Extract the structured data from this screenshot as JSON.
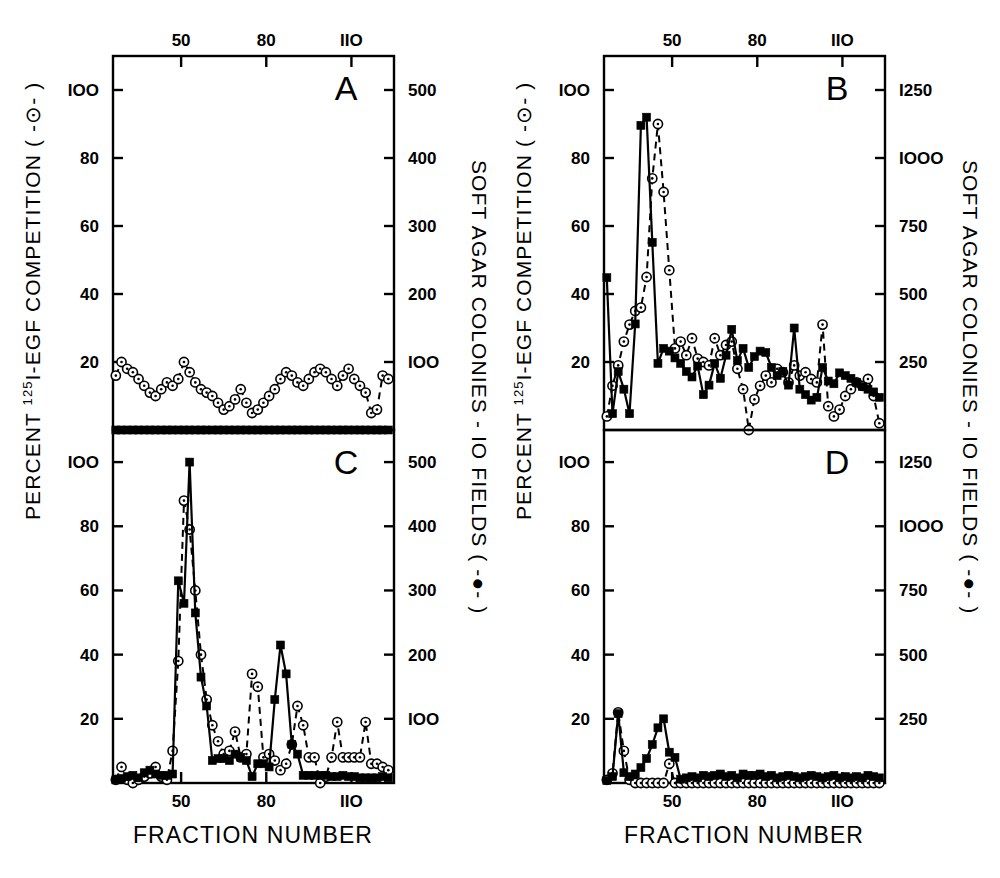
{
  "figure": {
    "background": "#ffffff",
    "ink_color": "#000000",
    "x_axis_title": "FRACTION NUMBER",
    "left_axis_title_prefix": "PERCENT ",
    "left_axis_title_sup": "125",
    "left_axis_title_suffix": "I-EGF COMPETITION  ( -⊙- )",
    "right_axis_title": "SOFT AGAR COLONIES - IO FIELDS  ( -●- )",
    "panel_labels": [
      "A",
      "B",
      "C",
      "D"
    ],
    "x_ticks": [
      50,
      80,
      110
    ],
    "left_ticks": [
      20,
      40,
      60,
      80,
      100
    ],
    "right_ticks_500": [
      100,
      200,
      300,
      400,
      500
    ],
    "right_ticks_1250": [
      250,
      500,
      750,
      1000,
      1250
    ],
    "legend": {
      "open_circle_meaning": "PERCENT 125I-EGF COMPETITION",
      "filled_square_meaning": "SOFT AGAR COLONIES - IO FIELDS"
    }
  },
  "chart_data": [
    {
      "type": "line",
      "panel": "A",
      "title": "A",
      "xlabel": "FRACTION NUMBER",
      "ylabel": "PERCENT 125I-EGF COMPETITION",
      "y2label": "SOFT AGAR COLONIES - IO FIELDS",
      "xlim": [
        26,
        125
      ],
      "ylim": [
        0,
        110
      ],
      "y2lim": [
        0,
        550
      ],
      "xticks": [
        50,
        80,
        110
      ],
      "yticks": [
        20,
        40,
        60,
        80,
        100
      ],
      "y2ticks": [
        100,
        200,
        300,
        400,
        500
      ],
      "grid": false,
      "xtick_position": "top",
      "series": [
        {
          "name": "PERCENT 125I-EGF COMPETITION",
          "marker": "open-circle",
          "line": "dashed",
          "axis": "left",
          "x": [
            27,
            29,
            31,
            33,
            35,
            37,
            39,
            41,
            43,
            45,
            47,
            49,
            51,
            53,
            55,
            57,
            59,
            61,
            63,
            65,
            67,
            69,
            71,
            73,
            75,
            77,
            79,
            81,
            83,
            85,
            87,
            89,
            91,
            93,
            95,
            97,
            99,
            101,
            103,
            105,
            107,
            109,
            111,
            113,
            115,
            117,
            119,
            121,
            123
          ],
          "y": [
            16,
            20,
            18,
            17,
            15,
            13,
            11,
            10,
            12,
            14,
            13,
            15,
            20,
            17,
            14,
            12,
            11,
            10,
            8,
            6,
            7,
            9,
            12,
            8,
            5,
            6,
            8,
            10,
            12,
            15,
            17,
            16,
            14,
            13,
            15,
            17,
            18,
            17,
            15,
            13,
            16,
            18,
            15,
            13,
            11,
            5,
            6,
            16,
            15
          ]
        },
        {
          "name": "SOFT AGAR COLONIES - IO FIELDS",
          "marker": "filled-square",
          "line": "solid",
          "axis": "right",
          "x": [
            27,
            29,
            31,
            33,
            35,
            37,
            39,
            41,
            43,
            45,
            47,
            49,
            51,
            53,
            55,
            57,
            59,
            61,
            63,
            65,
            67,
            69,
            71,
            73,
            75,
            77,
            79,
            81,
            83,
            85,
            87,
            89,
            91,
            93,
            95,
            97,
            99,
            101,
            103,
            105,
            107,
            109,
            111,
            113,
            115,
            117,
            119,
            121,
            123
          ],
          "y": [
            0,
            0,
            0,
            0,
            0,
            0,
            0,
            0,
            0,
            0,
            0,
            0,
            0,
            0,
            0,
            0,
            0,
            0,
            0,
            0,
            0,
            0,
            0,
            0,
            0,
            0,
            0,
            0,
            0,
            0,
            0,
            0,
            0,
            0,
            0,
            0,
            0,
            0,
            0,
            0,
            0,
            0,
            0,
            0,
            0,
            0,
            0,
            0,
            0
          ]
        }
      ]
    },
    {
      "type": "line",
      "panel": "B",
      "title": "B",
      "xlabel": "FRACTION NUMBER",
      "ylabel": "PERCENT 125I-EGF COMPETITION",
      "y2label": "SOFT AGAR COLONIES - IO FIELDS",
      "xlim": [
        26,
        125
      ],
      "ylim": [
        0,
        110
      ],
      "y2lim": [
        0,
        1375
      ],
      "xticks": [
        50,
        80,
        110
      ],
      "yticks": [
        20,
        40,
        60,
        80,
        100
      ],
      "y2ticks": [
        250,
        500,
        750,
        1000,
        1250
      ],
      "grid": false,
      "xtick_position": "top",
      "series": [
        {
          "name": "PERCENT 125I-EGF COMPETITION",
          "marker": "open-circle",
          "line": "dashed",
          "axis": "left",
          "x": [
            27,
            29,
            31,
            33,
            35,
            37,
            39,
            41,
            43,
            45,
            47,
            49,
            51,
            53,
            55,
            57,
            59,
            61,
            63,
            65,
            67,
            69,
            71,
            73,
            75,
            77,
            79,
            81,
            83,
            85,
            87,
            89,
            91,
            93,
            95,
            97,
            99,
            101,
            103,
            105,
            107,
            109,
            111,
            113,
            115,
            117,
            119,
            121,
            123
          ],
          "y": [
            4,
            13,
            19,
            26,
            31,
            35,
            36,
            45,
            74,
            90,
            70,
            47,
            24,
            26,
            22,
            27,
            21,
            20,
            19,
            27,
            22,
            25,
            26,
            18,
            12,
            0,
            9,
            13,
            16,
            14,
            18,
            17,
            14,
            19,
            16,
            17,
            15,
            14,
            31,
            7,
            4,
            6,
            10,
            12,
            14,
            13,
            15,
            10,
            2
          ]
        },
        {
          "name": "SOFT AGAR COLONIES - IO FIELDS",
          "marker": "filled-square",
          "line": "solid",
          "axis": "right",
          "x": [
            27,
            29,
            31,
            33,
            35,
            37,
            39,
            41,
            43,
            45,
            47,
            49,
            51,
            53,
            55,
            57,
            59,
            61,
            63,
            65,
            67,
            69,
            71,
            73,
            75,
            77,
            79,
            81,
            83,
            85,
            87,
            89,
            91,
            93,
            95,
            97,
            99,
            101,
            103,
            105,
            107,
            109,
            111,
            113,
            115,
            117,
            119,
            121,
            123
          ],
          "y": [
            560,
            60,
            215,
            150,
            60,
            390,
            1120,
            1150,
            690,
            245,
            300,
            290,
            265,
            245,
            215,
            195,
            235,
            130,
            165,
            245,
            190,
            275,
            370,
            255,
            300,
            230,
            270,
            290,
            285,
            230,
            200,
            215,
            165,
            375,
            150,
            130,
            110,
            120,
            230,
            180,
            170,
            210,
            200,
            190,
            175,
            160,
            150,
            140,
            120
          ]
        }
      ]
    },
    {
      "type": "line",
      "panel": "C",
      "title": "C",
      "xlabel": "FRACTION NUMBER",
      "ylabel": "PERCENT 125I-EGF COMPETITION",
      "y2label": "SOFT AGAR COLONIES - IO FIELDS",
      "xlim": [
        26,
        125
      ],
      "ylim": [
        0,
        110
      ],
      "y2lim": [
        0,
        550
      ],
      "xticks": [
        50,
        80,
        110
      ],
      "yticks": [
        20,
        40,
        60,
        80,
        100
      ],
      "y2ticks": [
        100,
        200,
        300,
        400,
        500
      ],
      "grid": false,
      "xtick_position": "bottom",
      "series": [
        {
          "name": "PERCENT 125I-EGF COMPETITION",
          "marker": "open-circle",
          "line": "dashed",
          "axis": "left",
          "x": [
            27,
            29,
            31,
            33,
            35,
            37,
            39,
            41,
            43,
            45,
            47,
            49,
            51,
            53,
            55,
            57,
            59,
            61,
            63,
            65,
            67,
            69,
            71,
            73,
            75,
            77,
            79,
            81,
            83,
            85,
            87,
            89,
            91,
            93,
            95,
            97,
            99,
            101,
            103,
            105,
            107,
            109,
            111,
            113,
            115,
            117,
            119,
            121,
            123
          ],
          "y": [
            1,
            5,
            1,
            0,
            1,
            2,
            3,
            5,
            2,
            1,
            10,
            38,
            88,
            79,
            60,
            40,
            26,
            18,
            13,
            9,
            10,
            16,
            8,
            9,
            34,
            30,
            8,
            9,
            7,
            4,
            6,
            12,
            24,
            18,
            8,
            8,
            0,
            2,
            8,
            19,
            8,
            8,
            8,
            8,
            19,
            6,
            6,
            5,
            4
          ]
        },
        {
          "name": "SOFT AGAR COLONIES - IO FIELDS",
          "marker": "filled-square",
          "line": "solid",
          "axis": "right",
          "x": [
            27,
            29,
            31,
            33,
            35,
            37,
            39,
            41,
            43,
            45,
            47,
            49,
            51,
            53,
            55,
            57,
            59,
            61,
            63,
            65,
            67,
            69,
            71,
            73,
            75,
            77,
            79,
            81,
            83,
            85,
            87,
            89,
            91,
            93,
            95,
            97,
            99,
            101,
            103,
            105,
            107,
            109,
            111,
            113,
            115,
            117,
            119,
            121,
            123
          ],
          "y": [
            5,
            7,
            10,
            12,
            8,
            16,
            20,
            14,
            12,
            12,
            14,
            315,
            280,
            500,
            265,
            165,
            120,
            35,
            38,
            38,
            35,
            45,
            40,
            35,
            10,
            30,
            30,
            25,
            130,
            215,
            170,
            60,
            45,
            12,
            12,
            12,
            12,
            12,
            10,
            10,
            12,
            10,
            10,
            8,
            8,
            8,
            8,
            10,
            8
          ]
        }
      ]
    },
    {
      "type": "line",
      "panel": "D",
      "title": "D",
      "xlabel": "FRACTION NUMBER",
      "ylabel": "PERCENT 125I-EGF COMPETITION",
      "y2label": "SOFT AGAR COLONIES - IO FIELDS",
      "xlim": [
        26,
        125
      ],
      "ylim": [
        0,
        110
      ],
      "y2lim": [
        0,
        1375
      ],
      "xticks": [
        50,
        80,
        110
      ],
      "yticks": [
        20,
        40,
        60,
        80,
        100
      ],
      "y2ticks": [
        250,
        500,
        750,
        1000,
        1250
      ],
      "grid": false,
      "xtick_position": "bottom",
      "series": [
        {
          "name": "PERCENT 125I-EGF COMPETITION",
          "marker": "open-circle",
          "line": "dashed",
          "axis": "left",
          "x": [
            27,
            29,
            31,
            33,
            35,
            37,
            39,
            41,
            43,
            45,
            47,
            49,
            51,
            53,
            55,
            57,
            59,
            61,
            63,
            65,
            67,
            69,
            71,
            73,
            75,
            77,
            79,
            81,
            83,
            85,
            87,
            89,
            91,
            93,
            95,
            97,
            99,
            101,
            103,
            105,
            107,
            109,
            111,
            113,
            115,
            117,
            119,
            121,
            123
          ],
          "y": [
            1,
            3,
            22,
            10,
            1,
            0,
            0,
            0,
            0,
            0,
            0,
            6,
            0,
            0,
            0,
            0,
            0,
            0,
            0,
            0,
            0,
            0,
            0,
            0,
            0,
            0,
            0,
            0,
            0,
            0,
            0,
            0,
            0,
            0,
            0,
            0,
            0,
            0,
            0,
            0,
            0,
            0,
            0,
            0,
            0,
            0,
            0,
            0,
            0
          ]
        },
        {
          "name": "SOFT AGAR COLONIES - IO FIELDS",
          "marker": "filled-square",
          "line": "solid",
          "axis": "right",
          "x": [
            27,
            29,
            31,
            33,
            35,
            37,
            39,
            41,
            43,
            45,
            47,
            49,
            51,
            53,
            55,
            57,
            59,
            61,
            63,
            65,
            67,
            69,
            71,
            73,
            75,
            77,
            79,
            81,
            83,
            85,
            87,
            89,
            91,
            93,
            95,
            97,
            99,
            101,
            103,
            105,
            107,
            109,
            111,
            113,
            115,
            117,
            119,
            121,
            123
          ],
          "y": [
            10,
            25,
            270,
            40,
            25,
            35,
            60,
            95,
            150,
            215,
            250,
            120,
            100,
            15,
            20,
            25,
            20,
            30,
            25,
            30,
            35,
            25,
            30,
            20,
            35,
            30,
            30,
            35,
            25,
            30,
            20,
            25,
            30,
            25,
            20,
            25,
            30,
            25,
            20,
            25,
            30,
            20,
            25,
            20,
            25,
            20,
            30,
            25,
            20
          ]
        }
      ]
    }
  ]
}
